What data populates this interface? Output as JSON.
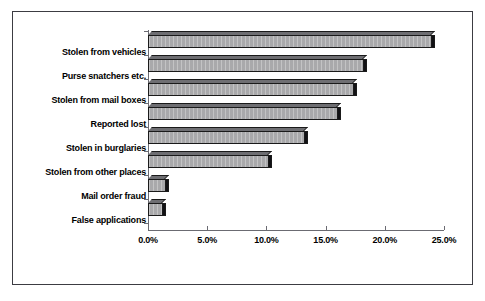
{
  "chart_data": {
    "type": "bar",
    "orientation": "horizontal",
    "title": "",
    "xlabel": "",
    "ylabel": "",
    "categories": [
      "Stolen from vehicles",
      "Purse snatchers etc.",
      "Stolen from mail boxes",
      "Reported lost",
      "Stolen in burglaries",
      "Stolen from other places",
      "Mail order fraud",
      "False applications"
    ],
    "values": [
      23.9,
      18.2,
      17.3,
      16.0,
      13.2,
      10.1,
      1.4,
      1.2
    ],
    "value_format": "percent",
    "xlim": [
      0,
      25
    ],
    "xticks": [
      0,
      5,
      10,
      15,
      20,
      25
    ],
    "xtick_labels": [
      "0.0%",
      "5.0%",
      "10.0%",
      "15.0%",
      "20.0%",
      "25.0%"
    ],
    "grid": false,
    "legend": false,
    "style": {
      "bar_fill": "#a9a9ab",
      "bar_outline": "#1a1a1a",
      "bar_shadow": "#111114",
      "bar_top": "#6e6e72",
      "axis_color": "#6b6b72",
      "frame_color": "#3c3c42",
      "background": "#ffffff",
      "text_color": "#000000",
      "three_d": true
    }
  }
}
